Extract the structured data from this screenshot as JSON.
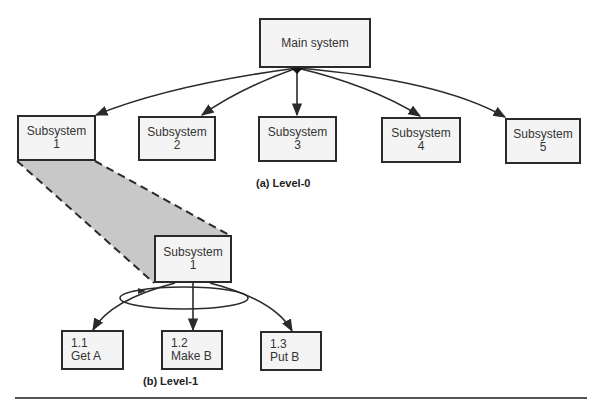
{
  "level0": {
    "root": {
      "label": "Main system"
    },
    "children": [
      {
        "line1": "Subsystem",
        "line2": "1"
      },
      {
        "line1": "Subsystem",
        "line2": "2"
      },
      {
        "line1": "Subsystem",
        "line2": "3"
      },
      {
        "line1": "Subsystem",
        "line2": "4"
      },
      {
        "line1": "Subsystem",
        "line2": "5"
      }
    ],
    "caption": "(a) Level-0"
  },
  "level1": {
    "root": {
      "line1": "Subsystem",
      "line2": "1"
    },
    "children": [
      {
        "line1": "1.1",
        "line2": "Get A"
      },
      {
        "line1": "1.2",
        "line2": "Make B"
      },
      {
        "line1": "1.3",
        "line2": "Put B"
      }
    ],
    "caption": "(b) Level-1"
  },
  "colors": {
    "stroke": "#2a2a2a",
    "shade": "#c8c8c8",
    "box_fill": "#f4f4f4"
  }
}
